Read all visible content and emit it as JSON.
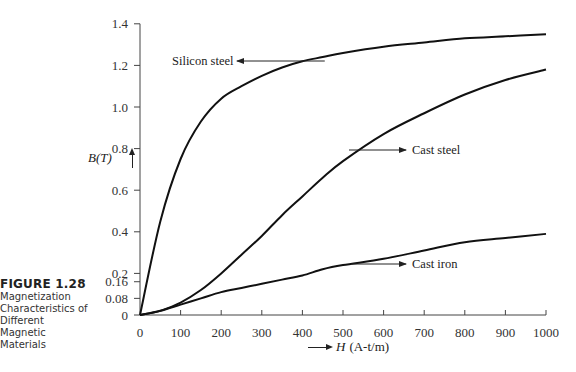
{
  "caption": {
    "figure_number": "FIGURE 1.28",
    "description_lines": [
      "Magnetization",
      "Characteristics of",
      "Different",
      "Magnetic",
      "Materials"
    ]
  },
  "axes": {
    "y_label": "B(T)",
    "x_label_symbol": "H",
    "x_label_units": "(A-t/m)",
    "y_ticks": [
      {
        "value": 1.4,
        "label": "1.4"
      },
      {
        "value": 1.2,
        "label": "1.2"
      },
      {
        "value": 1.0,
        "label": "1.0"
      },
      {
        "value": 0.8,
        "label": "0.8"
      },
      {
        "value": 0.6,
        "label": "0.6"
      },
      {
        "value": 0.4,
        "label": "0.4"
      },
      {
        "value": 0.2,
        "label": "0.2"
      },
      {
        "value": 0.16,
        "label": "0.16"
      },
      {
        "value": 0.08,
        "label": "0.08"
      },
      {
        "value": 0,
        "label": "0"
      }
    ],
    "x_ticks": [
      {
        "value": 0,
        "label": "0"
      },
      {
        "value": 100,
        "label": "100"
      },
      {
        "value": 200,
        "label": "200"
      },
      {
        "value": 300,
        "label": "300"
      },
      {
        "value": 400,
        "label": "400"
      },
      {
        "value": 500,
        "label": "500"
      },
      {
        "value": 600,
        "label": "600"
      },
      {
        "value": 700,
        "label": "700"
      },
      {
        "value": 800,
        "label": "800"
      },
      {
        "value": 900,
        "label": "900"
      },
      {
        "value": 1000,
        "label": "1000"
      }
    ]
  },
  "colors": {
    "line": "#111111",
    "axis": "#444444",
    "text": "#222222"
  },
  "chart_data": {
    "type": "line",
    "title": "Magnetization Characteristics of Different Magnetic Materials",
    "xlabel": "H (A-t/m)",
    "ylabel": "B(T)",
    "xlim": [
      0,
      1000
    ],
    "ylim": [
      0,
      1.4
    ],
    "grid": false,
    "legend": "inline labels with arrows",
    "x": [
      0,
      50,
      100,
      150,
      200,
      250,
      300,
      350,
      400,
      450,
      500,
      600,
      700,
      800,
      900,
      1000
    ],
    "series": [
      {
        "name": "Silicon steel",
        "values": [
          0,
          0.45,
          0.75,
          0.93,
          1.04,
          1.1,
          1.15,
          1.19,
          1.22,
          1.24,
          1.26,
          1.29,
          1.31,
          1.33,
          1.34,
          1.35
        ]
      },
      {
        "name": "Cast steel",
        "values": [
          0,
          0.02,
          0.06,
          0.12,
          0.2,
          0.29,
          0.38,
          0.48,
          0.57,
          0.66,
          0.74,
          0.87,
          0.97,
          1.06,
          1.13,
          1.18
        ]
      },
      {
        "name": "Cast iron",
        "values": [
          0,
          0.02,
          0.05,
          0.08,
          0.11,
          0.13,
          0.15,
          0.17,
          0.19,
          0.22,
          0.24,
          0.27,
          0.31,
          0.35,
          0.37,
          0.39
        ]
      }
    ],
    "annotations": [
      {
        "text": "Silicon steel",
        "arrow_to_x": 460,
        "arrow_to_y": 1.22
      },
      {
        "text": "Cast steel",
        "arrow_to_x": 520,
        "arrow_to_y": 0.8
      },
      {
        "text": "Cast iron",
        "arrow_to_x": 520,
        "arrow_to_y": 0.24
      }
    ]
  }
}
